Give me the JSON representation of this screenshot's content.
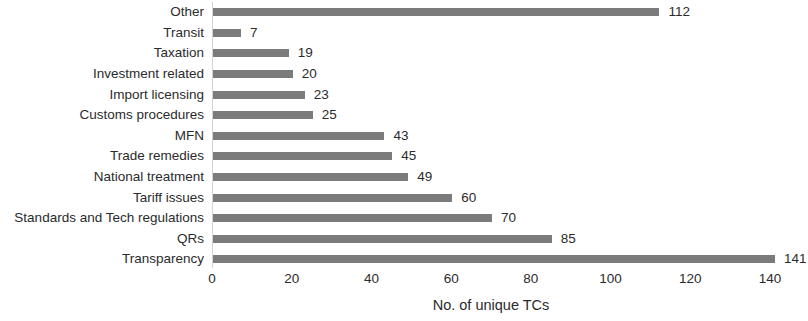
{
  "chart_data": {
    "type": "bar",
    "orientation": "horizontal",
    "title": "",
    "xlabel": "No. of unique TCs",
    "ylabel": "",
    "xlim": [
      0,
      140
    ],
    "xticks": [
      0,
      20,
      40,
      60,
      80,
      100,
      120,
      140
    ],
    "xtick_labels": [
      "0",
      "20",
      "40",
      "60",
      "80",
      "100",
      "120",
      "140"
    ],
    "grid": false,
    "legend": null,
    "bar_color": "#7b7b7b",
    "axis_color": "#d3d3d3",
    "text_color": "#2b2b2b",
    "categories": [
      "Other",
      "Transit",
      "Taxation",
      "Investment related",
      "Import licensing",
      "Customs procedures",
      "MFN",
      "Trade remedies",
      "National treatment",
      "Tariff issues",
      "Standards and Tech regulations",
      "QRs",
      "Transparency"
    ],
    "values": [
      112,
      7,
      19,
      20,
      23,
      25,
      43,
      45,
      49,
      60,
      70,
      85,
      141
    ],
    "data_labels": [
      "112",
      "7",
      "19",
      "20",
      "23",
      "25",
      "43",
      "45",
      "49",
      "60",
      "70",
      "85",
      "141"
    ],
    "bars": [
      {
        "category": "Other",
        "value": 112,
        "label": "112"
      },
      {
        "category": "Transit",
        "value": 7,
        "label": "7"
      },
      {
        "category": "Taxation",
        "value": 19,
        "label": "19"
      },
      {
        "category": "Investment related",
        "value": 20,
        "label": "20"
      },
      {
        "category": "Import licensing",
        "value": 23,
        "label": "23"
      },
      {
        "category": "Customs procedures",
        "value": 25,
        "label": "25"
      },
      {
        "category": "MFN",
        "value": 43,
        "label": "43"
      },
      {
        "category": "Trade remedies",
        "value": 45,
        "label": "45"
      },
      {
        "category": "National treatment",
        "value": 49,
        "label": "49"
      },
      {
        "category": "Tariff issues",
        "value": 60,
        "label": "60"
      },
      {
        "category": "Standards and Tech regulations",
        "value": 70,
        "label": "70"
      },
      {
        "category": "QRs",
        "value": 85,
        "label": "85"
      },
      {
        "category": "Transparency",
        "value": 141,
        "label": "141"
      }
    ]
  }
}
